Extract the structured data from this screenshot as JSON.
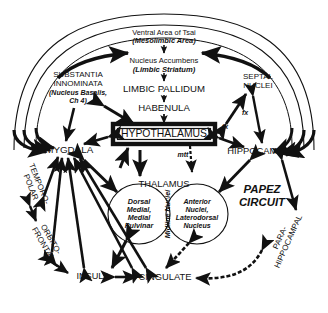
{
  "diagram": {
    "colors": {
      "ink": "#111111",
      "background": "#ffffff"
    },
    "nodes": {
      "tsai_l1": "Ventral Area of Tsai",
      "tsai_l2": "(Mesolimbic Area)",
      "accumbens_l1": "Nucleus Accumbens",
      "accumbens_l2": "(Limbic Striatum)",
      "pallidum": "LIMBIC PALLIDUM",
      "habenula": "HABENULA",
      "substantia_l1": "SUBSTANTIA",
      "substantia_l2": "INNOMINATA",
      "substantia_l3": "(Nucleus Basalis,",
      "substantia_l4": "Ch 4)",
      "septal_l1": "SEPTAL",
      "septal_l2": "NUCLEI",
      "hypothalamus": "HYPOTHALAMUS",
      "amygdala": "AMYGDALA",
      "hippocampus": "HIPPOCAMPUS",
      "thalamus": "THALAMUS",
      "dorsal_l1": "Dorsal",
      "dorsal_l2": "Medial,",
      "dorsal_l3": "Medial",
      "dorsal_l4": "Pulvinar",
      "anterior_l1": "Anterior",
      "anterior_l2": "Nuclei,",
      "anterior_l3": "Laterodorsal",
      "anterior_l4": "Nucleus",
      "midline": "Midline Nuclei",
      "papez_l1": "PAPEZ",
      "papez_l2": "CIRCUIT",
      "temporo_l1": "TEMPORO-",
      "temporo_l2": "POLAR",
      "orbito_l1": "ORBITO-",
      "orbito_l2": "FRONTAL",
      "parahippo_l1": "PARA-",
      "parahippo_l2": "HIPPOCAMPAL",
      "insula": "INSULA",
      "cingulate": "CINGULATE"
    },
    "tract_labels": {
      "fx_right": "fx",
      "fx_center": "fx",
      "mtt": "mtt"
    }
  }
}
